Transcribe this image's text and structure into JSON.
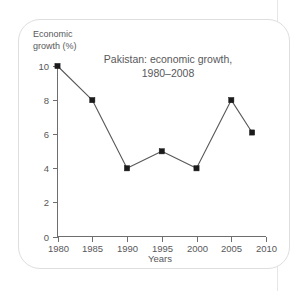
{
  "chart_data": {
    "type": "line",
    "title": "Pakistan: economic growth,",
    "title_line2": "1980–2008",
    "xlabel": "Years",
    "ylabel_line1": "Economic",
    "ylabel_line2": "growth (%)",
    "x": [
      1980,
      1985,
      1990,
      1995,
      2000,
      2005,
      2008
    ],
    "values": [
      10,
      8,
      4,
      5,
      4,
      8,
      6.1
    ],
    "xticks": [
      1980,
      1985,
      1990,
      1995,
      2000,
      2005,
      2010
    ],
    "xtick_labels": [
      "1980",
      "1985",
      "1990",
      "1995",
      "2000",
      "2005",
      "2010"
    ],
    "yticks": [
      0,
      2,
      4,
      6,
      8,
      10
    ],
    "ytick_labels": [
      "0",
      "2",
      "4",
      "6",
      "8",
      "10"
    ],
    "xlim": [
      1980,
      2010
    ],
    "ylim": [
      0,
      10
    ],
    "grid": false,
    "legend": false,
    "marker": "square",
    "line_color": "#58585a",
    "marker_color": "#1b1b1b",
    "axis_color": "#6e6e6e",
    "text_color": "#58585a",
    "frame_color": "#dedede",
    "background": "#ffffff"
  }
}
